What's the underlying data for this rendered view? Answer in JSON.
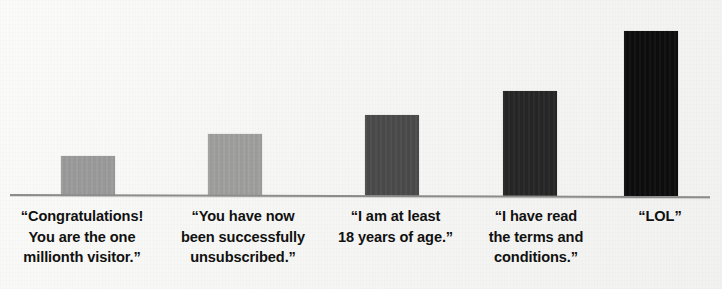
{
  "chart_data": {
    "type": "bar",
    "title": "",
    "subtitle": "",
    "xlabel": "",
    "ylabel": "",
    "ylim": [
      0,
      180
    ],
    "grid": false,
    "legend": false,
    "categories": [
      "“Congratulations! You are the one millionth visitor.”",
      "“You have now been successfully unsubscribed.”",
      "“I am at least 18 years of age.”",
      "“I have read the terms and conditions.”",
      "“LOL”"
    ],
    "values": [
      40,
      62,
      81,
      105,
      165
    ],
    "bar_colors": [
      "#9c9c9c",
      "#a0a09f",
      "#4b4b4b",
      "#262626",
      "#0d0d0d"
    ],
    "axis_color": "#8d8d8d",
    "background_color": "#f7f7f5",
    "label_color": "#111111"
  },
  "chart": {
    "bars": [
      {
        "value": 40,
        "color": "#9c9c9c",
        "label_lines": [
          "“Congratulations!",
          "You are the one",
          "millionth visitor.”"
        ]
      },
      {
        "value": 62,
        "color": "#a0a09f",
        "label_lines": [
          "“You have now",
          "been successfully",
          "unsubscribed.”"
        ]
      },
      {
        "value": 81,
        "color": "#4b4b4b",
        "label_lines": [
          "“I am at least",
          "18 years of age.”"
        ]
      },
      {
        "value": 105,
        "color": "#262626",
        "label_lines": [
          "“I have read",
          "the terms and",
          "conditions.”"
        ]
      },
      {
        "value": 165,
        "color": "#0d0d0d",
        "label_lines": [
          "“LOL”"
        ]
      }
    ]
  }
}
